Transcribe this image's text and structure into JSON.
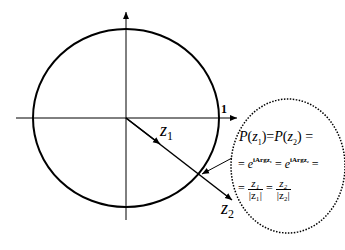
{
  "diagram": {
    "type": "unit-circle-complex-plane",
    "colors": {
      "stroke": "#000000",
      "background": "#ffffff"
    },
    "labels": {
      "unit": "1",
      "z1": {
        "base": "z",
        "sub": "1"
      },
      "z2": {
        "base": "z",
        "sub": "2"
      }
    },
    "callout": {
      "line1": "P(z₁) = P(z₂) =",
      "line1_parts": {
        "p1": "P",
        "z1": "z",
        "s1": "1",
        "p2": "P",
        "z2": "z",
        "s2": "2",
        "eq": "="
      },
      "line2_parts": {
        "lead": "=",
        "e1": "e",
        "exp1": "iArgz₁",
        "mid": "=",
        "e2": "e",
        "exp2": "iArgz₂",
        "tail": "="
      },
      "line3_parts": {
        "lead": "=",
        "num1": "z₁",
        "den1": "|z₁|",
        "mid": "=",
        "num2": "z₂",
        "den2": "|z₂|"
      }
    }
  }
}
